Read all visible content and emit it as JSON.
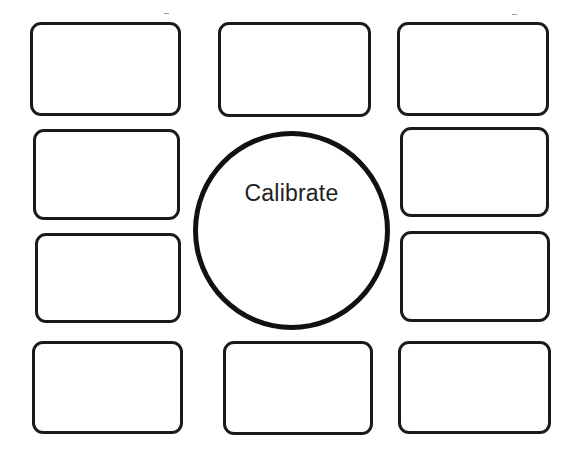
{
  "diagram": {
    "type": "hub-and-boxes",
    "colors": {
      "background": "#ffffff",
      "stroke": "#1a1a1a",
      "text": "#222222"
    },
    "center": {
      "shape": "circle",
      "label": "Calibrate"
    },
    "boxes": [
      {
        "id": "box-top-left",
        "label": ""
      },
      {
        "id": "box-top-center",
        "label": ""
      },
      {
        "id": "box-top-right",
        "label": ""
      },
      {
        "id": "box-row2-left",
        "label": ""
      },
      {
        "id": "box-row2-right",
        "label": ""
      },
      {
        "id": "box-row3-left",
        "label": ""
      },
      {
        "id": "box-row3-right",
        "label": ""
      },
      {
        "id": "box-bottom-left",
        "label": ""
      },
      {
        "id": "box-bottom-center",
        "label": ""
      },
      {
        "id": "box-bottom-right",
        "label": ""
      }
    ]
  }
}
